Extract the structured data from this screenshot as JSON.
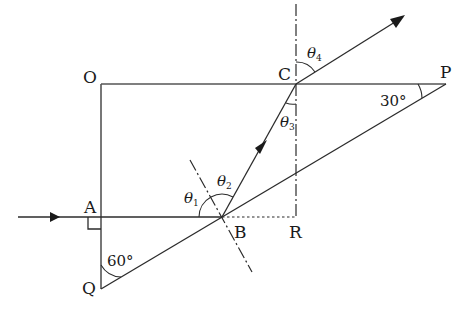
{
  "diagram": {
    "type": "ray-optics-prism",
    "points": {
      "O": {
        "label": "O",
        "x": 101,
        "y": 84
      },
      "C": {
        "label": "C",
        "x": 296,
        "y": 84
      },
      "P": {
        "label": "P",
        "x": 446,
        "y": 84
      },
      "A": {
        "label": "A",
        "x": 101,
        "y": 217
      },
      "B": {
        "label": "B",
        "x": 222,
        "y": 217
      },
      "R": {
        "label": "R",
        "x": 296,
        "y": 217
      },
      "Q": {
        "label": "Q",
        "x": 101,
        "y": 289
      }
    },
    "angles": {
      "Q": "60°",
      "P": "30°",
      "theta1": {
        "symbol": "θ",
        "sub": "1"
      },
      "theta2": {
        "symbol": "θ",
        "sub": "2"
      },
      "theta3": {
        "symbol": "θ",
        "sub": "3"
      },
      "theta4": {
        "symbol": "θ",
        "sub": "4"
      }
    },
    "colors": {
      "ink": "#1a1a1a",
      "frame": "#555555",
      "background": "#ffffff"
    }
  }
}
